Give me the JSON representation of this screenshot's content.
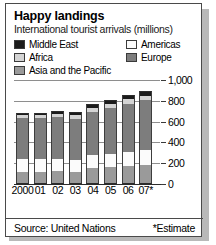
{
  "title": "Happy landings",
  "subtitle": "International tourist arrivals (millions)",
  "footer": {
    "source": "Source: United Nations",
    "estimate_note": "*Estimate"
  },
  "legend": [
    {
      "label": "Middle East",
      "color": "#1c1c1c"
    },
    {
      "label": "Africa",
      "color": "#d4d4d4"
    },
    {
      "label": "Asia and the Pacific",
      "color": "#9a9a9a"
    },
    {
      "label": "Americas",
      "color": "#fbfbfb"
    },
    {
      "label": "Europe",
      "color": "#7d7d7d"
    }
  ],
  "chart_data": {
    "type": "bar",
    "title": "Happy landings",
    "subtitle": "International tourist arrivals (millions)",
    "xlabel": "",
    "ylabel": "millions",
    "ylim": [
      0,
      1000
    ],
    "yticks": [
      "0",
      "200",
      "400",
      "600",
      "800",
      "1,000"
    ],
    "ytick_values": [
      0,
      200,
      400,
      600,
      800,
      1000
    ],
    "grid": true,
    "stacked": true,
    "legend_position": "top",
    "categories": [
      "2000",
      "01",
      "02",
      "03",
      "04",
      "05",
      "06",
      "07*"
    ],
    "series": [
      {
        "name": "Asia and the Pacific",
        "color": "#9a9a9a",
        "values": [
          115,
          120,
          128,
          115,
          150,
          160,
          175,
          185
        ]
      },
      {
        "name": "Americas",
        "color": "#fbfbfb",
        "values": [
          128,
          122,
          117,
          113,
          126,
          133,
          136,
          142
        ]
      },
      {
        "name": "Europe",
        "color": "#7d7d7d",
        "values": [
          393,
          390,
          397,
          400,
          420,
          440,
          462,
          480
        ]
      },
      {
        "name": "Africa",
        "color": "#d4d4d4",
        "values": [
          27,
          29,
          30,
          31,
          34,
          37,
          41,
          44
        ]
      },
      {
        "name": "Middle East",
        "color": "#1c1c1c",
        "values": [
          25,
          25,
          29,
          30,
          36,
          39,
          41,
          47
        ]
      }
    ],
    "totals": [
      688,
      686,
      701,
      689,
      766,
      809,
      855,
      898
    ],
    "annotations": [
      "*Estimate"
    ],
    "source": "Source: United Nations"
  }
}
